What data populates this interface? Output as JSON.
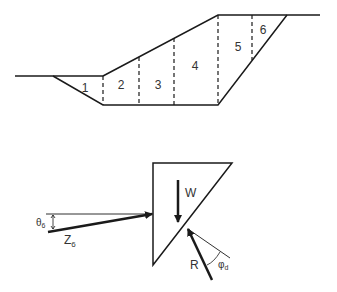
{
  "slope_section": {
    "slice_labels": [
      "1",
      "2",
      "3",
      "4",
      "5",
      "6"
    ]
  },
  "wedge_diagram": {
    "weight_label": "W",
    "reaction_label": "R",
    "interslice_force_label": "Z",
    "interslice_force_subscript": "6",
    "angle_theta_label": "θ",
    "angle_theta_subscript": "6",
    "angle_phi_label": "φ",
    "angle_phi_subscript": "d"
  },
  "colors": {
    "line": "#1a1a1a",
    "text": "#333333",
    "background": "#ffffff"
  }
}
